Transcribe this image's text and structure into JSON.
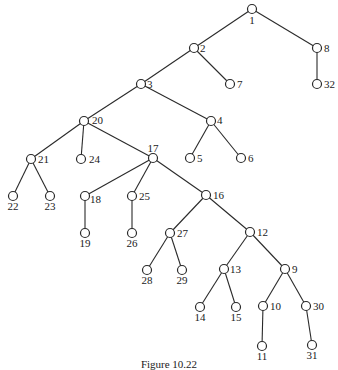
{
  "figure": {
    "caption": "Figure 10.22",
    "type": "tree",
    "nodes": [
      {
        "id": "1",
        "x": 252,
        "y": 9,
        "lx": 252,
        "ly": 24,
        "anchor": "middle"
      },
      {
        "id": "2",
        "x": 194,
        "y": 48,
        "lx": 200,
        "ly": 52,
        "anchor": "start"
      },
      {
        "id": "8",
        "x": 317,
        "y": 48,
        "lx": 324,
        "ly": 52,
        "anchor": "start"
      },
      {
        "id": "3",
        "x": 141,
        "y": 84,
        "lx": 147,
        "ly": 88,
        "anchor": "start"
      },
      {
        "id": "7",
        "x": 230,
        "y": 84,
        "lx": 237,
        "ly": 88,
        "anchor": "start"
      },
      {
        "id": "32",
        "x": 317,
        "y": 84,
        "lx": 324,
        "ly": 88,
        "anchor": "start"
      },
      {
        "id": "20",
        "x": 84,
        "y": 121,
        "lx": 92,
        "ly": 124,
        "anchor": "start"
      },
      {
        "id": "4",
        "x": 211,
        "y": 121,
        "lx": 217,
        "ly": 124,
        "anchor": "start"
      },
      {
        "id": "21",
        "x": 31,
        "y": 159,
        "lx": 38,
        "ly": 163,
        "anchor": "start"
      },
      {
        "id": "24",
        "x": 81,
        "y": 159,
        "lx": 89,
        "ly": 163,
        "anchor": "start"
      },
      {
        "id": "17",
        "x": 153,
        "y": 158,
        "lx": 153,
        "ly": 152,
        "anchor": "middle"
      },
      {
        "id": "5",
        "x": 190,
        "y": 158,
        "lx": 197,
        "ly": 162,
        "anchor": "start"
      },
      {
        "id": "6",
        "x": 241,
        "y": 158,
        "lx": 248,
        "ly": 162,
        "anchor": "start"
      },
      {
        "id": "22",
        "x": 13,
        "y": 196,
        "lx": 13,
        "ly": 210,
        "anchor": "middle"
      },
      {
        "id": "23",
        "x": 50,
        "y": 196,
        "lx": 50,
        "ly": 210,
        "anchor": "middle"
      },
      {
        "id": "18",
        "x": 85,
        "y": 196,
        "lx": 90,
        "ly": 203,
        "anchor": "start"
      },
      {
        "id": "25",
        "x": 132,
        "y": 196,
        "lx": 139,
        "ly": 200,
        "anchor": "start"
      },
      {
        "id": "16",
        "x": 206,
        "y": 195,
        "lx": 213,
        "ly": 199,
        "anchor": "start"
      },
      {
        "id": "19",
        "x": 85,
        "y": 233,
        "lx": 85,
        "ly": 247,
        "anchor": "middle"
      },
      {
        "id": "26",
        "x": 132,
        "y": 233,
        "lx": 132,
        "ly": 247,
        "anchor": "middle"
      },
      {
        "id": "27",
        "x": 170,
        "y": 233,
        "lx": 177,
        "ly": 237,
        "anchor": "start"
      },
      {
        "id": "12",
        "x": 250,
        "y": 232,
        "lx": 257,
        "ly": 236,
        "anchor": "start"
      },
      {
        "id": "28",
        "x": 147,
        "y": 270,
        "lx": 147,
        "ly": 284,
        "anchor": "middle"
      },
      {
        "id": "29",
        "x": 182,
        "y": 270,
        "lx": 182,
        "ly": 284,
        "anchor": "middle"
      },
      {
        "id": "13",
        "x": 224,
        "y": 269,
        "lx": 230,
        "ly": 273,
        "anchor": "start"
      },
      {
        "id": "9",
        "x": 285,
        "y": 269,
        "lx": 292,
        "ly": 273,
        "anchor": "start"
      },
      {
        "id": "14",
        "x": 200,
        "y": 307,
        "lx": 200,
        "ly": 321,
        "anchor": "middle"
      },
      {
        "id": "15",
        "x": 236,
        "y": 307,
        "lx": 236,
        "ly": 321,
        "anchor": "middle"
      },
      {
        "id": "10",
        "x": 263,
        "y": 306,
        "lx": 270,
        "ly": 310,
        "anchor": "start"
      },
      {
        "id": "30",
        "x": 306,
        "y": 306,
        "lx": 313,
        "ly": 310,
        "anchor": "start"
      },
      {
        "id": "11",
        "x": 262,
        "y": 346,
        "lx": 262,
        "ly": 360,
        "anchor": "middle"
      },
      {
        "id": "31",
        "x": 312,
        "y": 345,
        "lx": 312,
        "ly": 359,
        "anchor": "middle"
      }
    ],
    "edges": [
      [
        "1",
        "2"
      ],
      [
        "1",
        "8"
      ],
      [
        "8",
        "32"
      ],
      [
        "2",
        "3"
      ],
      [
        "2",
        "7"
      ],
      [
        "3",
        "20"
      ],
      [
        "3",
        "4"
      ],
      [
        "4",
        "5"
      ],
      [
        "4",
        "6"
      ],
      [
        "20",
        "21"
      ],
      [
        "20",
        "24"
      ],
      [
        "20",
        "17"
      ],
      [
        "21",
        "22"
      ],
      [
        "21",
        "23"
      ],
      [
        "17",
        "18"
      ],
      [
        "17",
        "25"
      ],
      [
        "17",
        "16"
      ],
      [
        "18",
        "19"
      ],
      [
        "25",
        "26"
      ],
      [
        "16",
        "27"
      ],
      [
        "16",
        "12"
      ],
      [
        "27",
        "28"
      ],
      [
        "27",
        "29"
      ],
      [
        "12",
        "13"
      ],
      [
        "12",
        "9"
      ],
      [
        "13",
        "14"
      ],
      [
        "13",
        "15"
      ],
      [
        "9",
        "10"
      ],
      [
        "9",
        "30"
      ],
      [
        "10",
        "11"
      ],
      [
        "30",
        "31"
      ]
    ]
  }
}
